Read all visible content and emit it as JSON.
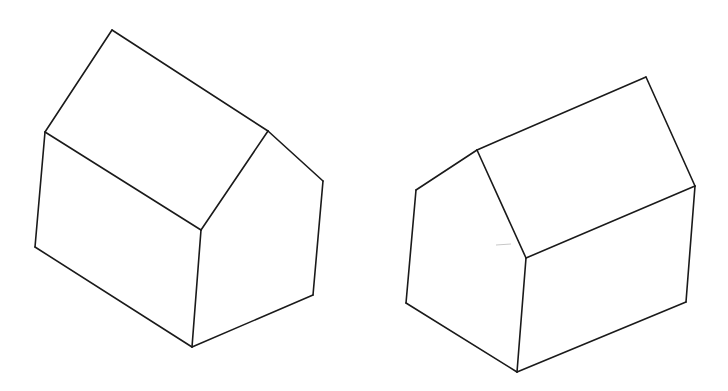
{
  "figure": {
    "colors": {
      "background": "#ffffff",
      "line": "#1a1a1a"
    },
    "houses": [
      {
        "id": "left-house",
        "view": "roof ridge running down-right, gable end on right",
        "vertices": {
          "roof_apex_back": [
            112,
            30
          ],
          "left_eave": [
            45,
            132
          ],
          "ridge_front": [
            268,
            131
          ],
          "front_eave_corner": [
            201,
            230
          ],
          "gable_right_corner": [
            323,
            181
          ],
          "base_left": [
            35,
            247
          ],
          "base_center": [
            192,
            347
          ],
          "base_right": [
            313,
            295
          ]
        },
        "edges": [
          [
            "roof_apex_back",
            "left_eave"
          ],
          [
            "roof_apex_back",
            "ridge_front"
          ],
          [
            "left_eave",
            "front_eave_corner"
          ],
          [
            "ridge_front",
            "front_eave_corner"
          ],
          [
            "ridge_front",
            "gable_right_corner"
          ],
          [
            "left_eave",
            "base_left"
          ],
          [
            "front_eave_corner",
            "base_center"
          ],
          [
            "gable_right_corner",
            "base_right"
          ],
          [
            "base_left",
            "base_center"
          ],
          [
            "base_center",
            "base_right"
          ]
        ]
      },
      {
        "id": "right-house",
        "view": "roof ridge running up-right, gable end on left",
        "vertices": {
          "gable_left_corner": [
            416,
            190
          ],
          "gable_apex": [
            477,
            150
          ],
          "ridge_back": [
            646,
            77
          ],
          "right_eave": [
            695,
            186
          ],
          "front_eave_corner": [
            526,
            258
          ],
          "base_left": [
            406,
            303
          ],
          "base_center": [
            517,
            372
          ],
          "base_right": [
            686,
            302
          ]
        },
        "edges": [
          [
            "gable_left_corner",
            "gable_apex"
          ],
          [
            "gable_apex",
            "ridge_back"
          ],
          [
            "ridge_back",
            "right_eave"
          ],
          [
            "gable_apex",
            "front_eave_corner"
          ],
          [
            "front_eave_corner",
            "right_eave"
          ],
          [
            "gable_left_corner",
            "base_left"
          ],
          [
            "front_eave_corner",
            "base_center"
          ],
          [
            "right_eave",
            "base_right"
          ],
          [
            "base_left",
            "base_center"
          ],
          [
            "base_center",
            "base_right"
          ]
        ]
      }
    ]
  }
}
